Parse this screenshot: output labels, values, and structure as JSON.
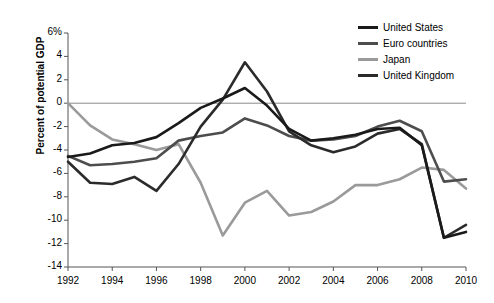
{
  "chart_data": {
    "type": "line",
    "title": "",
    "subtitle": "",
    "xlabel": "",
    "ylabel": "Percent of potential GDP",
    "ylim": [
      -14,
      6
    ],
    "xlim": [
      1992,
      2010
    ],
    "grid": false,
    "zero_line": true,
    "legend_position": "top-right",
    "y_ticks": [
      "6%",
      "4",
      "2",
      "0",
      "-2",
      "-4",
      "-6",
      "-8",
      "-10",
      "-12",
      "-14"
    ],
    "y_tick_values": [
      6,
      4,
      2,
      0,
      -2,
      -4,
      -6,
      -8,
      -10,
      -12,
      -14
    ],
    "x_ticks": [
      "1992",
      "1994",
      "1996",
      "1998",
      "2000",
      "2002",
      "2004",
      "2006",
      "2008",
      "2010"
    ],
    "x_tick_values": [
      1992,
      1994,
      1996,
      1998,
      2000,
      2002,
      2004,
      2006,
      2008,
      2010
    ],
    "x": [
      1992,
      1993,
      1994,
      1995,
      1996,
      1997,
      1998,
      1999,
      2000,
      2001,
      2002,
      2003,
      2004,
      2005,
      2006,
      2007,
      2008,
      2009,
      2010
    ],
    "series": [
      {
        "name": "United States",
        "color": "#1a1a1a",
        "width": 2.6,
        "values": [
          -4.6,
          -4.3,
          -3.6,
          -3.4,
          -2.9,
          -1.7,
          -0.4,
          0.4,
          1.3,
          -0.2,
          -2.2,
          -3.2,
          -3.0,
          -2.7,
          -2.2,
          -2.1,
          -3.6,
          -11.5,
          -11.0
        ]
      },
      {
        "name": "Euro countries",
        "color": "#4d4d4d",
        "width": 2.6,
        "values": [
          -4.5,
          -5.3,
          -5.2,
          -5.0,
          -4.7,
          -3.2,
          -2.8,
          -2.5,
          -1.3,
          -1.9,
          -2.8,
          -3.2,
          -3.1,
          -2.8,
          -2.0,
          -1.5,
          -2.4,
          -6.7,
          -6.5
        ]
      },
      {
        "name": "Japan",
        "color": "#9a9a9a",
        "width": 2.6,
        "values": [
          0.0,
          -1.9,
          -3.1,
          -3.5,
          -4.0,
          -3.5,
          -6.8,
          -11.3,
          -8.5,
          -7.5,
          -9.6,
          -9.3,
          -8.4,
          -7.0,
          -7.0,
          -6.5,
          -5.5,
          -5.7,
          -7.3
        ]
      },
      {
        "name": "United Kingdom",
        "color": "#2b2b2b",
        "width": 2.6,
        "values": [
          -5.0,
          -6.8,
          -6.9,
          -6.3,
          -7.5,
          -5.2,
          -2.0,
          0.3,
          3.5,
          1.0,
          -2.4,
          -3.6,
          -4.2,
          -3.7,
          -2.6,
          -2.2,
          -3.5,
          -11.5,
          -10.4
        ]
      }
    ]
  },
  "legend": {
    "items": [
      {
        "label": "United States",
        "color": "#1a1a1a"
      },
      {
        "label": "Euro countries",
        "color": "#4d4d4d"
      },
      {
        "label": "Japan",
        "color": "#9a9a9a"
      },
      {
        "label": "United Kingdom",
        "color": "#2b2b2b"
      }
    ]
  }
}
